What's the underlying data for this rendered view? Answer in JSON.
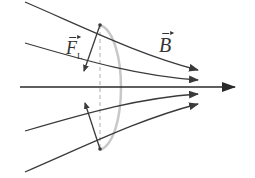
{
  "diagram": {
    "labels": {
      "field": "B",
      "force": "F",
      "force_subscript": "L"
    },
    "colors": {
      "field_lines": "#3a3a3a",
      "loop": "#c8c8c8",
      "force_arrows": "#3a3a3a",
      "background": "#ffffff"
    },
    "field_lines_count": 5,
    "force_arrows_count": 2
  }
}
